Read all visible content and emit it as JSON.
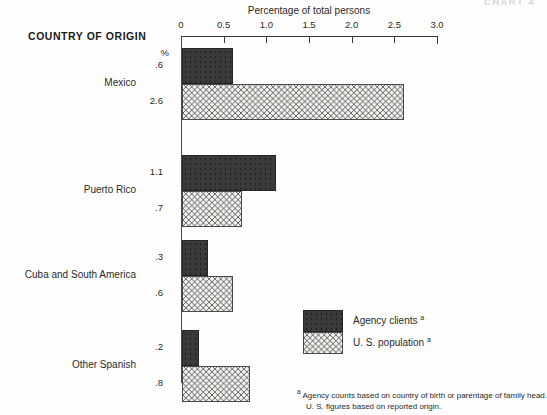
{
  "chart_id": "CHART 4",
  "headings": {
    "country_of_origin": "COUNTRY OF ORIGIN",
    "axis_title": "Percentage of total persons",
    "percent_symbol": "%"
  },
  "legend": {
    "items": [
      {
        "label": "Agency clients",
        "marker": "a",
        "pattern": "dark-stipple",
        "color": "#3b3a38"
      },
      {
        "label": "U. S. population",
        "marker": "a",
        "pattern": "cross-hatch",
        "color": "#f2f2f0"
      }
    ]
  },
  "footnote": {
    "marker": "a",
    "line1": "Agency counts based on country of birth or parentage of family head.",
    "line2": "U. S. figures based on reported origin."
  },
  "chart_data": {
    "type": "bar",
    "orientation": "horizontal",
    "title": "Percentage of total persons",
    "xlabel": "Percentage of total persons",
    "ylabel": "COUNTRY OF ORIGIN",
    "xlim": [
      0,
      3.0
    ],
    "xticks": [
      0,
      0.5,
      1.0,
      1.5,
      2.0,
      2.5,
      3.0
    ],
    "xtick_labels": [
      "0",
      "0.5",
      "1.0",
      "1.5",
      "2.0",
      "2.5",
      "3.0"
    ],
    "grid": false,
    "axis_position": "top",
    "legend_position": "inside-bottom-right",
    "categories": [
      "Mexico",
      "Puerto Rico",
      "Cuba and South America",
      "Other Spanish"
    ],
    "series": [
      {
        "name": "Agency clients",
        "pattern": "dark-stipple",
        "values": [
          0.6,
          1.1,
          0.3,
          0.2
        ],
        "value_labels": [
          ".6",
          "1.1",
          ".3",
          ".2"
        ]
      },
      {
        "name": "U. S. population",
        "pattern": "cross-hatch",
        "values": [
          2.6,
          0.7,
          0.6,
          0.8
        ],
        "value_labels": [
          "2.6",
          ".7",
          ".6",
          ".8"
        ]
      }
    ]
  }
}
